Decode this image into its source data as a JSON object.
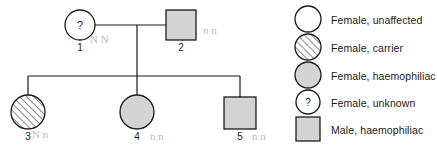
{
  "figure": {
    "type": "pedigree-diagram"
  },
  "colors": {
    "stroke": "#1a1a1a",
    "affected_fill": "#d4d4d4",
    "unaffected_fill": "#ffffff",
    "hatch_stroke": "#4a4a4a",
    "pencil": "#b9b9b9",
    "background": "#ffffff"
  },
  "pedigree": {
    "individuals": [
      {
        "id": "1",
        "label": "1",
        "sex": "female",
        "shape": "circle",
        "status": "unknown",
        "fill": "none",
        "inner_text": "?",
        "generation": 1,
        "cx": 80,
        "cy": 25,
        "r": 15
      },
      {
        "id": "2",
        "label": "2",
        "sex": "male",
        "shape": "square",
        "status": "haemophiliac",
        "fill": "solid",
        "inner_text": "",
        "generation": 1,
        "cx": 181,
        "cy": 25,
        "r": 15
      },
      {
        "id": "3",
        "label": "3",
        "sex": "female",
        "shape": "circle",
        "status": "carrier",
        "fill": "hatched",
        "inner_text": "",
        "generation": 2,
        "cx": 28,
        "cy": 112,
        "r": 17
      },
      {
        "id": "4",
        "label": "4",
        "sex": "female",
        "shape": "circle",
        "status": "haemophiliac",
        "fill": "solid",
        "inner_text": "",
        "generation": 2,
        "cx": 137,
        "cy": 112,
        "r": 17
      },
      {
        "id": "5",
        "label": "5",
        "sex": "male",
        "shape": "square",
        "status": "haemophiliac",
        "fill": "solid",
        "inner_text": "",
        "generation": 2,
        "cx": 240,
        "cy": 113,
        "r": 16
      }
    ],
    "mating_line": {
      "x1": 95,
      "x2": 166,
      "y": 25
    },
    "descent_line": {
      "x": 137,
      "y1": 25,
      "y2": 76
    },
    "sibship_line": {
      "x1": 28,
      "x2": 240,
      "y": 76
    },
    "child_drops": [
      {
        "x": 28,
        "y1": 76,
        "y2": 95
      },
      {
        "x": 137,
        "y1": 76,
        "y2": 95
      },
      {
        "x": 240,
        "y1": 76,
        "y2": 97
      }
    ],
    "pencil_annotations": [
      {
        "text": "N N",
        "x": 90,
        "y": 34
      },
      {
        "text": "n n",
        "x": 203,
        "y": 25
      },
      {
        "text": "N n",
        "x": 32,
        "y": 129
      },
      {
        "text": "n n",
        "x": 150,
        "y": 131
      },
      {
        "text": "n n",
        "x": 252,
        "y": 131
      }
    ]
  },
  "legend": {
    "entries": [
      {
        "label": "Female, unaffected",
        "shape": "circle",
        "fill": "none",
        "inner_text": "",
        "cx": 308,
        "cy": 19,
        "r": 13,
        "text_x": 331,
        "text_y": 15
      },
      {
        "label": "Female, carrier",
        "shape": "circle",
        "fill": "hatched",
        "inner_text": "",
        "cx": 308,
        "cy": 47,
        "r": 13,
        "text_x": 331,
        "text_y": 43
      },
      {
        "label": "Female, haemophiliac",
        "shape": "circle",
        "fill": "solid",
        "inner_text": "",
        "cx": 308,
        "cy": 75,
        "r": 13,
        "text_x": 331,
        "text_y": 71
      },
      {
        "label": "Female, unknown",
        "shape": "circle",
        "fill": "none",
        "inner_text": "?",
        "cx": 308,
        "cy": 102,
        "r": 12,
        "text_x": 331,
        "text_y": 98
      },
      {
        "label": "Male, haemophiliac",
        "shape": "square",
        "fill": "solid",
        "inner_text": "",
        "cx": 308,
        "cy": 129,
        "r": 12,
        "text_x": 331,
        "text_y": 125
      }
    ]
  }
}
